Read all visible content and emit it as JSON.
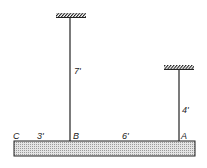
{
  "figure": {
    "beam": {
      "x": 14,
      "y": 141,
      "width": 181,
      "height": 15,
      "fill": "#cfcfcf"
    },
    "hangers": [
      {
        "id": "B",
        "x": 70,
        "top": 18,
        "length_label": "7'",
        "support_hatch": {
          "x": 56,
          "y": 13,
          "width": 30
        }
      },
      {
        "id": "A",
        "x": 179,
        "top": 70,
        "length_label": "4'",
        "support_hatch": {
          "x": 164,
          "y": 65,
          "width": 30
        }
      }
    ],
    "point_labels": {
      "C": "C",
      "B": "B",
      "A": "A"
    },
    "dimensions": {
      "CB": "3'",
      "BA": "6'"
    }
  }
}
